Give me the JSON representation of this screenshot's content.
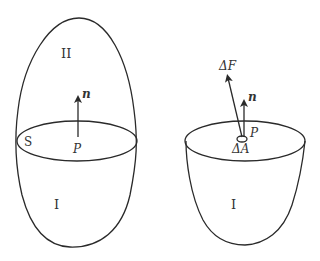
{
  "left_figure": {
    "region_upper_label": "II",
    "region_lower_label": "I",
    "surface_label": "S",
    "point_label": "P",
    "normal_label": "n"
  },
  "right_figure": {
    "region_label": "I",
    "point_label": "P",
    "normal_label": "n",
    "force_label": "ΔF",
    "area_label": "ΔA"
  },
  "colors": {
    "stroke": "#2a2a2a",
    "text": "#333333",
    "background": "#ffffff"
  }
}
